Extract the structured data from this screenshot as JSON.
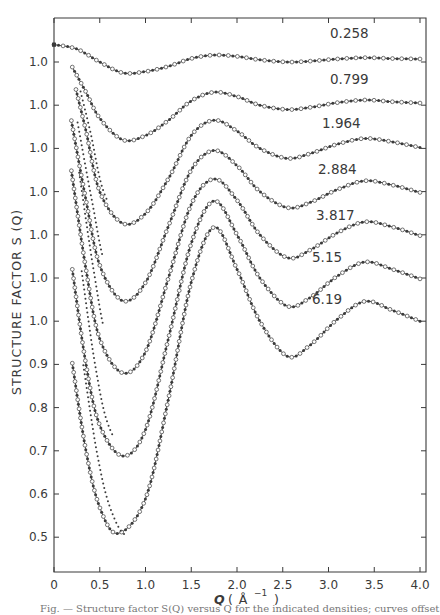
{
  "chart_data": {
    "type": "line",
    "title": "",
    "xlabel": "Q (Å⁻¹)",
    "ylabel": "STRUCTURE   FACTOR   S(Q)",
    "xlim": [
      0,
      4.0
    ],
    "x_ticks": [
      "0",
      "0.5",
      "1.0",
      "1.5",
      "2.0",
      "2.5",
      "3.0",
      "3.5",
      "4.0"
    ],
    "y_ticks": [
      "1.0",
      "1.0",
      "1.0",
      "1.0",
      "1.0",
      "1.0",
      "1.0",
      "0.9",
      "0.8",
      "0.7",
      "0.6",
      "0.5"
    ],
    "offset_note": "Curves are vertically offset; each curve's 1.0 baseline corresponds to one of the stacked 1.0 tick marks",
    "grid": false,
    "legend": "inline labels per curve",
    "markers": "open circles (solid line through them) and dots/crosses (comparison data)",
    "series": [
      {
        "name": "0.258",
        "x": [
          0.0,
          0.25,
          0.5,
          0.75,
          1.0,
          1.25,
          1.5,
          1.75,
          2.0,
          2.25,
          2.55,
          2.8,
          3.1,
          3.4,
          3.7,
          4.0
        ],
        "values": [
          1.04,
          1.03,
          1.0,
          0.975,
          0.978,
          0.99,
          1.008,
          1.016,
          1.013,
          1.005,
          1.0,
          1.002,
          1.007,
          1.01,
          1.008,
          1.007
        ]
      },
      {
        "name": "0.799",
        "x": [
          0.2,
          0.35,
          0.5,
          0.75,
          1.0,
          1.25,
          1.5,
          1.75,
          2.0,
          2.25,
          2.55,
          2.8,
          3.1,
          3.4,
          3.7,
          4.0
        ],
        "values": [
          1.088,
          1.03,
          0.97,
          0.92,
          0.93,
          0.965,
          1.01,
          1.03,
          1.02,
          1.0,
          0.99,
          0.995,
          1.006,
          1.012,
          1.008,
          1.005
        ]
      },
      {
        "name": "1.964",
        "x": [
          0.24,
          0.35,
          0.5,
          0.75,
          1.0,
          1.25,
          1.5,
          1.75,
          2.0,
          2.25,
          2.55,
          2.8,
          3.1,
          3.4,
          3.7,
          4.0
        ],
        "values": [
          1.136,
          1.04,
          0.9,
          0.827,
          0.85,
          0.93,
          1.03,
          1.065,
          1.04,
          1.0,
          0.977,
          0.988,
          1.01,
          1.023,
          1.015,
          1.002
        ]
      },
      {
        "name": "2.884",
        "x": [
          0.19,
          0.35,
          0.5,
          0.75,
          1.0,
          1.25,
          1.5,
          1.75,
          2.0,
          2.25,
          2.55,
          2.8,
          3.1,
          3.4,
          3.7,
          4.0
        ],
        "values": [
          1.164,
          0.98,
          0.83,
          0.748,
          0.79,
          0.92,
          1.05,
          1.095,
          1.06,
          1.0,
          0.963,
          0.975,
          1.005,
          1.025,
          1.015,
          0.998
        ]
      },
      {
        "name": "3.817",
        "x": [
          0.19,
          0.35,
          0.5,
          0.75,
          1.0,
          1.25,
          1.5,
          1.75,
          2.0,
          2.25,
          2.55,
          2.8,
          3.1,
          3.4,
          3.7,
          4.0
        ],
        "values": [
          1.148,
          0.92,
          0.76,
          0.681,
          0.73,
          0.9,
          1.07,
          1.129,
          1.08,
          1.0,
          0.947,
          0.965,
          1.005,
          1.03,
          1.018,
          0.998
        ]
      },
      {
        "name": "5.15",
        "x": [
          0.2,
          0.35,
          0.5,
          0.75,
          1.0,
          1.25,
          1.5,
          1.75,
          2.0,
          2.25,
          2.55,
          2.8,
          3.1,
          3.4,
          3.7,
          4.0
        ],
        "values": [
          1.02,
          0.8,
          0.66,
          0.589,
          0.65,
          0.86,
          1.08,
          1.178,
          1.1,
          1.0,
          0.935,
          0.955,
          1.005,
          1.037,
          1.02,
          0.998
        ]
      },
      {
        "name": "6.19",
        "x": [
          0.2,
          0.35,
          0.5,
          0.7,
          1.0,
          1.25,
          1.5,
          1.75,
          2.0,
          2.25,
          2.55,
          2.8,
          3.1,
          3.4,
          3.7,
          4.0
        ],
        "values": [
          0.903,
          0.7,
          0.57,
          0.51,
          0.59,
          0.82,
          1.09,
          1.217,
          1.12,
          1.0,
          0.919,
          0.945,
          1.005,
          1.046,
          1.025,
          1.0
        ]
      }
    ]
  },
  "labels": {
    "xlabel_q": "Q",
    "xlabel_unit": "( Å",
    "xlabel_exp": "−1",
    "xlabel_close": ")",
    "ylabel": "STRUCTURE   FACTOR   S (Q)",
    "caption": "Fig. — Structure factor S(Q) versus Q for the indicated densities; curves offset vertically."
  },
  "style": {
    "ink": "#3a3a3a",
    "background": "#ffffff"
  }
}
